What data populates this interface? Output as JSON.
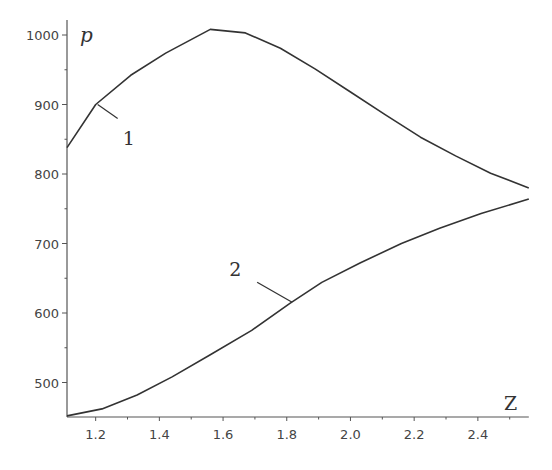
{
  "chart_data": {
    "type": "line",
    "title": "",
    "xlabel": "Z",
    "ylabel": "p",
    "xlim": [
      1.11,
      2.56
    ],
    "ylim": [
      450,
      1010
    ],
    "grid": false,
    "legend": "none (curves labeled inline with leader lines)",
    "x_ticks": [
      "1.2",
      "1.4",
      "1.6",
      "1.8",
      "2.0",
      "2.2",
      "2.4"
    ],
    "y_ticks": [
      "500",
      "600",
      "700",
      "800",
      "900",
      "1000"
    ],
    "annotations": [
      {
        "text": "1",
        "points_to_series": "1",
        "at": [
          1.2,
          900
        ]
      },
      {
        "text": "2",
        "points_to_series": "2",
        "at": [
          1.82,
          617
        ]
      }
    ],
    "series": [
      {
        "name": "1",
        "x": [
          1.11,
          1.2,
          1.31,
          1.42,
          1.56,
          1.67,
          1.78,
          1.89,
          2.0,
          2.11,
          2.22,
          2.33,
          2.44,
          2.56
        ],
        "y": [
          838,
          900,
          942,
          974,
          1008,
          1003,
          981,
          951,
          918,
          885,
          853,
          826,
          801,
          780
        ]
      },
      {
        "name": "2",
        "x": [
          1.11,
          1.22,
          1.33,
          1.44,
          1.56,
          1.69,
          1.81,
          1.91,
          2.03,
          2.16,
          2.28,
          2.41,
          2.56
        ],
        "y": [
          452,
          462,
          482,
          508,
          540,
          575,
          614,
          644,
          672,
          700,
          722,
          743,
          764
        ]
      }
    ]
  },
  "plot": {
    "axis_color": "#555555",
    "line_color": "#333333"
  }
}
